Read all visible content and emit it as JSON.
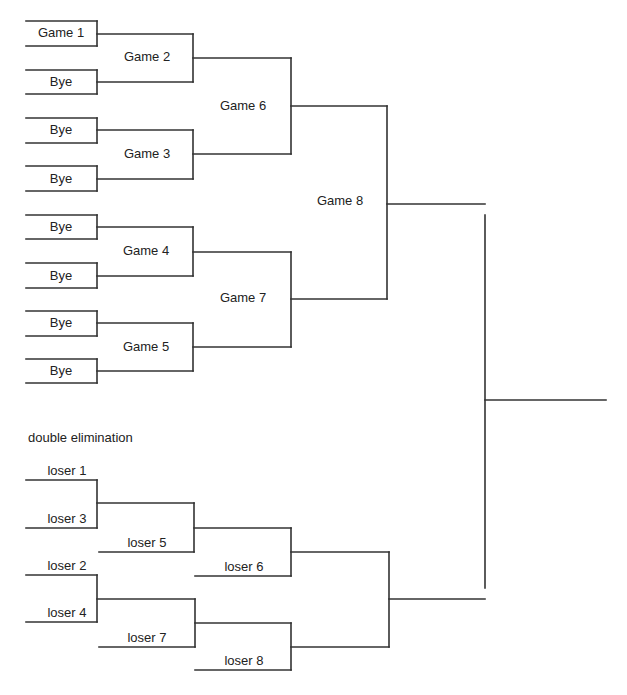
{
  "diagram": {
    "type": "tournament-bracket",
    "winners_bracket": {
      "first_round": [
        {
          "label": "Game 1"
        },
        {
          "label": "Bye"
        },
        {
          "label": "Bye"
        },
        {
          "label": "Bye"
        },
        {
          "label": "Bye"
        },
        {
          "label": "Bye"
        },
        {
          "label": "Bye"
        },
        {
          "label": "Bye"
        }
      ],
      "second_round": [
        {
          "label": "Game 2"
        },
        {
          "label": "Game 3"
        },
        {
          "label": "Game 4"
        },
        {
          "label": "Game 5"
        }
      ],
      "semifinals": [
        {
          "label": "Game 6"
        },
        {
          "label": "Game 7"
        }
      ],
      "final": {
        "label": "Game 8"
      }
    },
    "losers_bracket": {
      "title": "double elimination",
      "entries": [
        {
          "label": "loser 1"
        },
        {
          "label": "loser 3"
        },
        {
          "label": "loser 5"
        },
        {
          "label": "loser 6"
        },
        {
          "label": "loser 2"
        },
        {
          "label": "loser 4"
        },
        {
          "label": "loser 7"
        },
        {
          "label": "loser 8"
        }
      ]
    },
    "line_color": "#333333",
    "background": "#ffffff"
  }
}
